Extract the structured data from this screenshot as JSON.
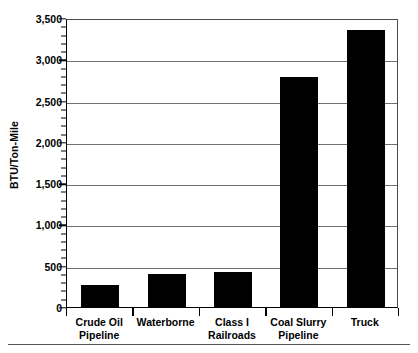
{
  "chart_data": {
    "type": "bar",
    "title": "",
    "subtitle": "",
    "xlabel": "",
    "ylabel": "BTU/Ton-Mile",
    "ylim": [
      0,
      3500
    ],
    "ytick_step": 500,
    "yminor_step": 100,
    "grid": true,
    "legend": false,
    "orientation": "vertical",
    "bar_color": "#000000",
    "gridline_color": "#6f6f6f",
    "axis_color": "#000000",
    "background_color": "#ffffff",
    "categories": [
      "Crude Oil Pipeline",
      "Waterborne",
      "Class I Railroads",
      "Coal Slurry Pipeline",
      "Truck"
    ],
    "category_label_lines": [
      [
        "Crude Oil",
        "Pipeline"
      ],
      [
        "Waterborne",
        ""
      ],
      [
        "Class I",
        "Railroads"
      ],
      [
        "Coal Slurry",
        "Pipeline"
      ],
      [
        "Truck",
        ""
      ]
    ],
    "values": [
      270,
      400,
      420,
      2780,
      3350
    ],
    "ytick_labels": [
      "0",
      "500",
      "1,000",
      "1,500",
      "2,000",
      "2,500",
      "3,000",
      "3,500"
    ],
    "ytick_values": [
      0,
      500,
      1000,
      1500,
      2000,
      2500,
      3000,
      3500
    ]
  }
}
